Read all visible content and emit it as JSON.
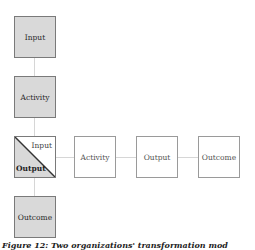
{
  "diagram": {
    "vertical_column": {
      "boxes": [
        {
          "label": "Input",
          "style": "gray"
        },
        {
          "label": "Activity",
          "style": "gray"
        },
        {
          "split_top_label": "Input",
          "split_bottom_label": "Output",
          "style": "split"
        },
        {
          "label": "Outcome",
          "style": "gray"
        }
      ]
    },
    "horizontal_row": {
      "boxes": [
        {
          "label": "Activity",
          "style": "white"
        },
        {
          "label": "Output",
          "style": "white"
        },
        {
          "label": "Outcome",
          "style": "white"
        }
      ]
    },
    "colors": {
      "gray_fill": "#d9d9d9",
      "border": "#7a7a7a",
      "connector": "#d6d6d6"
    }
  },
  "caption": "Figure 12: Two organizations' transformation mod"
}
